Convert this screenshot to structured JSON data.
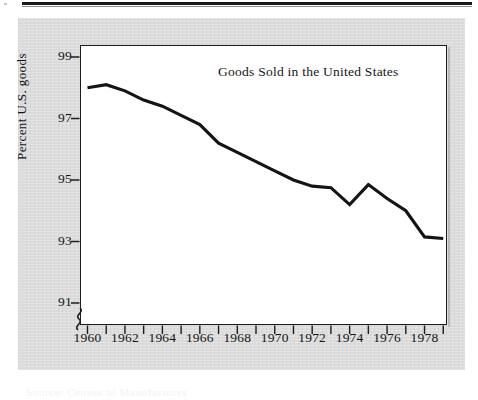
{
  "figure": {
    "y_axis_title": "Percent U.S. goods",
    "plot_title": "Goods Sold in the United States",
    "caption_ghost": "Source: Census of Manufactures",
    "line_color": "#141414",
    "frame_color": "#1c1c1c",
    "panel_color": "#dcdcdc",
    "plot_background": "#ffffff",
    "broken_axis_symbol": "y-axis-break"
  },
  "chart_data": {
    "type": "line",
    "title": "Goods Sold in the United States",
    "xlabel": "",
    "ylabel": "Percent U.S. goods",
    "xlim": [
      1959.6,
      1979.2
    ],
    "ylim": [
      90.2,
      99.6
    ],
    "grid": false,
    "legend": null,
    "axis_break": {
      "axis": "y",
      "note": "broken scale below 91"
    },
    "ytick_labels": [
      "99",
      "97",
      "95",
      "93",
      "91"
    ],
    "ytick_values": [
      99,
      97,
      95,
      93,
      91
    ],
    "ytick_minor_count": 0,
    "xtick_labels": [
      "1960",
      "1962",
      "1964",
      "1966",
      "1968",
      "1970",
      "1972",
      "1974",
      "1976",
      "1978"
    ],
    "xtick_labeled_values": [
      1960,
      1962,
      1964,
      1966,
      1968,
      1970,
      1972,
      1974,
      1976,
      1978
    ],
    "xtick_all_values": [
      1960,
      1961,
      1962,
      1963,
      1964,
      1965,
      1966,
      1967,
      1968,
      1969,
      1970,
      1971,
      1972,
      1973,
      1974,
      1975,
      1976,
      1977,
      1978,
      1979
    ],
    "x": [
      1960,
      1961,
      1962,
      1963,
      1964,
      1965,
      1966,
      1967,
      1968,
      1969,
      1970,
      1971,
      1972,
      1973,
      1974,
      1975,
      1976,
      1977,
      1978,
      1979
    ],
    "values": [
      98.0,
      98.1,
      97.9,
      97.6,
      97.4,
      97.1,
      96.8,
      96.2,
      95.9,
      95.6,
      95.3,
      95.0,
      94.8,
      94.75,
      94.2,
      94.85,
      94.4,
      94.0,
      93.15,
      93.1
    ],
    "series": [
      {
        "name": "Percent U.S. goods",
        "values": [
          98.0,
          98.1,
          97.9,
          97.6,
          97.4,
          97.1,
          96.8,
          96.2,
          95.9,
          95.6,
          95.3,
          95.0,
          94.8,
          94.75,
          94.2,
          94.85,
          94.4,
          94.0,
          93.15,
          93.1
        ]
      }
    ]
  }
}
